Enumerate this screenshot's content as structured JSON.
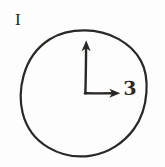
{
  "figure": {
    "panel_label": "I",
    "axis_value_label": "3",
    "background_color": "#fdfdfd",
    "ink_color": "#2a2725",
    "circle": {
      "center_x": 84,
      "center_y": 93,
      "radius": 62,
      "stroke_width": 2.2
    },
    "origin": {
      "x": 85,
      "y": 93
    },
    "vertical_arrow": {
      "name": "vertical-axis-arrow",
      "direction": "up",
      "tip_x": 86,
      "tip_y": 41,
      "length": 52,
      "stroke_width": 2.4
    },
    "horizontal_arrow": {
      "name": "horizontal-axis-arrow",
      "direction": "right",
      "tip_x": 120,
      "tip_y": 93,
      "length": 35,
      "stroke_width": 2.4,
      "value": "3"
    }
  }
}
